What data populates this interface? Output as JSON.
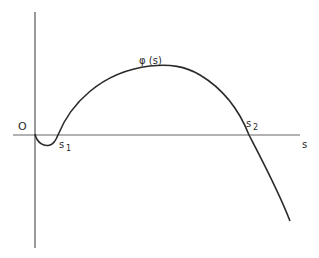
{
  "figure": {
    "type": "function-graph",
    "function_label": "φ (s)",
    "origin_label": "O",
    "x_axis_label": "s",
    "roots": [
      {
        "label": "s",
        "subscript": "1"
      },
      {
        "label": "s",
        "subscript": "2"
      }
    ],
    "colors": {
      "axis": "#555555",
      "curve": "#2a2a2a",
      "background": "#ffffff"
    }
  }
}
